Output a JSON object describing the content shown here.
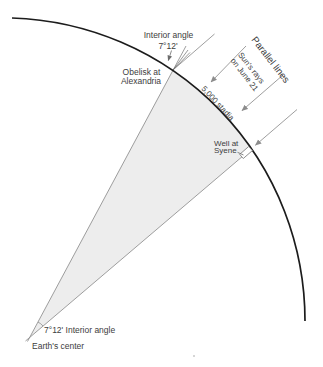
{
  "diagram": {
    "labels": {
      "interior_angle_top": {
        "line1": "Interior angle",
        "line2": "7°12'"
      },
      "obelisk": {
        "line1": "Obelisk at",
        "line2": "Alexandria"
      },
      "parallel_lines": "Parallel lines",
      "sun_rays": {
        "line1": "Sun's rays",
        "line2": "on June 21"
      },
      "stadia": "5,000 stadia",
      "well": {
        "line1": "Well at",
        "line2": "Syene"
      },
      "interior_angle_bottom": "7°12' Interior angle",
      "earths_center": "Earth's center"
    },
    "colors": {
      "arc": "#1c1c1c",
      "line": "#8c8c8c",
      "leader": "#6b6b6b",
      "text": "#3d3d3d",
      "wedge": "#ededed"
    }
  }
}
